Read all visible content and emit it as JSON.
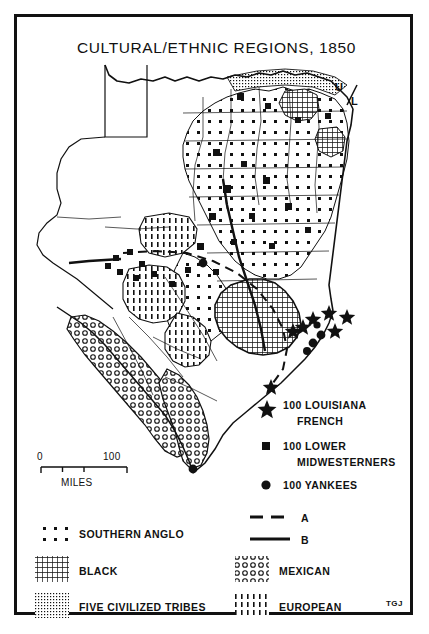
{
  "map": {
    "title": "CULTURAL/ETHNIC REGIONS, 1850",
    "signature": "TGJ",
    "inline_label": "U/L",
    "scale": {
      "min_label": "0",
      "max_label": "100",
      "units_label": "MILES"
    }
  },
  "symbol_legend": {
    "items": [
      {
        "icon": "star-symbol",
        "line1": "100 LOUISIANA",
        "line2": "FRENCH"
      },
      {
        "icon": "square-symbol",
        "line1": "100 LOWER",
        "line2": "MIDWESTERNERS"
      },
      {
        "icon": "circle-symbol",
        "line1": "100 YANKEES",
        "line2": ""
      }
    ]
  },
  "line_legend": {
    "items": [
      {
        "style": "dashed-line",
        "label": "A"
      },
      {
        "style": "solid-line",
        "label": "B"
      }
    ]
  },
  "pattern_legend": {
    "left_column": [
      {
        "pattern": "sparse-dots",
        "label": "SOUTHERN ANGLO"
      },
      {
        "pattern": "dense-crosshatch",
        "label": "BLACK"
      },
      {
        "pattern": "fine-dot-grid",
        "label": "FIVE CIVILIZED TRIBES"
      }
    ],
    "right_column": [
      {
        "pattern": "open-circles",
        "label": "MEXICAN"
      },
      {
        "pattern": "vertical-dashes",
        "label": "EUROPEAN"
      }
    ]
  },
  "colors": {
    "ink": "#111111",
    "paper": "#ffffff"
  }
}
